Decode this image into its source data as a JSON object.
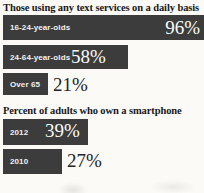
{
  "chart_data": {
    "type": "bar",
    "title": "",
    "xlabel": "",
    "ylabel": "",
    "orientation": "horizontal",
    "panels": [
      {
        "title": "Those using any text services on a daily basis",
        "categories": [
          "16-24-year-olds",
          "24-64-year-olds",
          "Over 65"
        ],
        "values": [
          96,
          58,
          21
        ],
        "value_labels": [
          "96%",
          "58%",
          "21%"
        ],
        "unit": "%",
        "xlim": [
          0,
          100
        ]
      },
      {
        "title": "Percent of adults who own a smartphone",
        "categories": [
          "2012",
          "2010"
        ],
        "values": [
          39,
          27
        ],
        "value_labels": [
          "39%",
          "27%"
        ],
        "unit": "%",
        "xlim": [
          0,
          100
        ]
      }
    ],
    "colors": {
      "bar": "#3c3c3c",
      "value_inside": "#fbfbf8",
      "value_outside": "#232325",
      "background": "#fbfaf7",
      "title_text": "#18181a"
    },
    "grid": false,
    "legend": null
  }
}
